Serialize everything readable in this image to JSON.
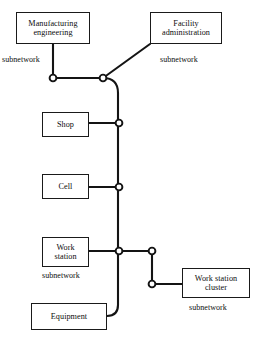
{
  "diagram": {
    "stroke_color": "#141414",
    "node_fill_color": "#ffffff",
    "background_color": "#ffffff",
    "boxes": [
      {
        "id": "manufacturing-engineering",
        "line1": "Manufacturing",
        "line2": "engineering"
      },
      {
        "id": "facility-administration",
        "line1": "Facility",
        "line2": "administration"
      },
      {
        "id": "shop",
        "line1": "Shop",
        "line2": ""
      },
      {
        "id": "cell",
        "line1": "Cell",
        "line2": ""
      },
      {
        "id": "work-station",
        "line1": "Work",
        "line2": "station"
      },
      {
        "id": "equipment",
        "line1": "Equipment",
        "line2": ""
      },
      {
        "id": "work-station-cluster",
        "line1": "Work station",
        "line2": "cluster"
      }
    ],
    "captions": {
      "manufacturing_subnetwork": "subnetwork",
      "facility_subnetwork": "subnetwork",
      "work_station_subnetwork": "subnetwork",
      "cluster_subnetwork": "subnetwork"
    }
  }
}
